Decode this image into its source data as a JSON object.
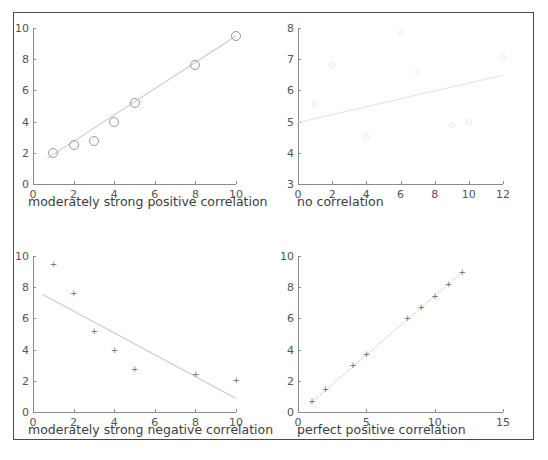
{
  "figure": {
    "background": "#ffffff",
    "frame_color": "#4a4a4a",
    "axis_color": "#8a8a8a",
    "text_color": "#3d3d3d"
  },
  "chart_data": [
    {
      "id": "moderately-strong-positive",
      "type": "scatter",
      "title": "",
      "xlabel": "moderately strong positive correlation",
      "ylabel": "",
      "xlim": [
        0,
        10
      ],
      "ylim": [
        0,
        10
      ],
      "xticks": [
        0,
        2,
        4,
        6,
        8,
        10
      ],
      "yticks": [
        0,
        2,
        4,
        6,
        8,
        10
      ],
      "grid": false,
      "legend": "none",
      "marker": "circle",
      "x": [
        1,
        2,
        3,
        4,
        5,
        8,
        10
      ],
      "y": [
        2.0,
        2.5,
        2.75,
        3.95,
        5.2,
        7.6,
        9.5
      ],
      "trendline": {
        "x0": 0.7,
        "y0": 1.65,
        "x1": 10.0,
        "y1": 9.5
      }
    },
    {
      "id": "no-correlation",
      "type": "scatter",
      "title": "",
      "xlabel": "no correlation",
      "ylabel": "",
      "xlim": [
        0,
        12
      ],
      "ylim": [
        3,
        8
      ],
      "xticks": [
        0,
        2,
        4,
        6,
        8,
        10,
        12
      ],
      "yticks": [
        3,
        4,
        5,
        6,
        7,
        8
      ],
      "grid": false,
      "legend": "none",
      "marker": "dot",
      "x": [
        1,
        2,
        4,
        6,
        7,
        9,
        10,
        12
      ],
      "y": [
        5.55,
        6.8,
        4.5,
        7.85,
        6.6,
        4.9,
        5.0,
        7.05
      ],
      "trendline": {
        "x0": 0.0,
        "y0": 4.98,
        "x1": 12.0,
        "y1": 6.5
      }
    },
    {
      "id": "moderately-strong-negative",
      "type": "scatter",
      "title": "",
      "xlabel": "moderately strong negative correlation",
      "ylabel": "",
      "xlim": [
        0,
        10
      ],
      "ylim": [
        0,
        10
      ],
      "xticks": [
        0,
        2,
        4,
        6,
        8,
        10
      ],
      "yticks": [
        0,
        2,
        4,
        6,
        8,
        10
      ],
      "grid": false,
      "legend": "none",
      "marker": "plus",
      "x": [
        1,
        2,
        3,
        4,
        5,
        8,
        10
      ],
      "y": [
        9.5,
        7.6,
        5.2,
        3.95,
        2.75,
        2.45,
        2.05
      ],
      "trendline": {
        "x0": 0.5,
        "y0": 7.55,
        "x1": 10.0,
        "y1": 0.9
      }
    },
    {
      "id": "perfect-positive",
      "type": "scatter",
      "title": "",
      "xlabel": "perfect positive correlation",
      "ylabel": "",
      "xlim": [
        0,
        15
      ],
      "ylim": [
        0,
        10
      ],
      "xticks": [
        0,
        5,
        10,
        15
      ],
      "yticks": [
        0,
        2,
        4,
        6,
        8,
        10
      ],
      "grid": false,
      "legend": "none",
      "marker": "plus",
      "x": [
        1,
        2,
        4,
        5,
        8,
        9,
        10,
        11,
        12
      ],
      "y": [
        0.7,
        1.5,
        3.0,
        3.75,
        6.05,
        6.75,
        7.45,
        8.2,
        9.0
      ],
      "trendline": {
        "x0": 0.9,
        "y0": 0.6,
        "x1": 12.0,
        "y1": 9.0
      }
    }
  ]
}
